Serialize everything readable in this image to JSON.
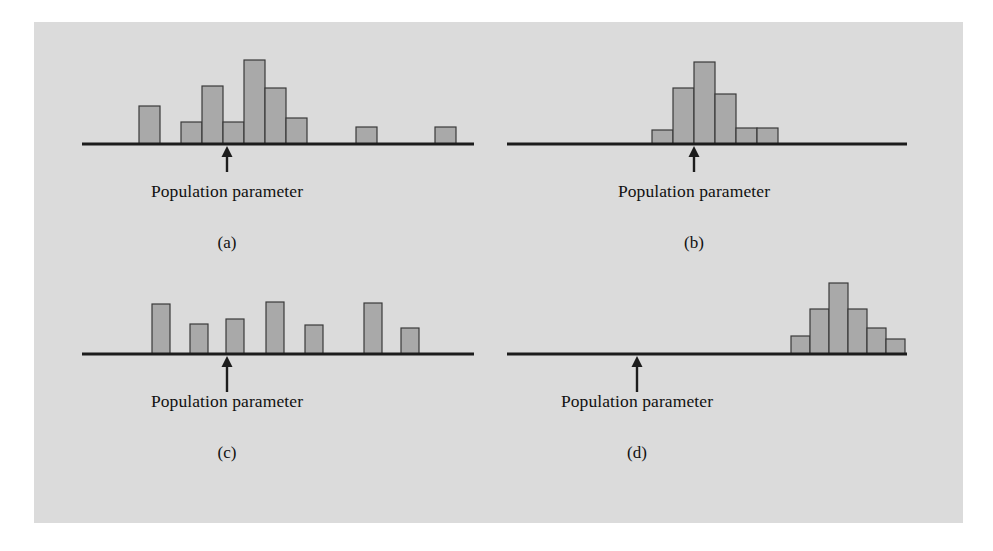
{
  "figure": {
    "background_color": "#dbdbdb",
    "page_color": "#ffffff",
    "bar_fill_color": "#a9a9a9",
    "bar_border_color": "#3a3a3a",
    "axis_color": "#1c1c1c",
    "text_color": "#111111"
  },
  "panels": {
    "a": {
      "caption": "(a)",
      "param_label": "Population parameter",
      "description": "biased, high variability"
    },
    "b": {
      "caption": "(b)",
      "param_label": "Population parameter",
      "description": "unbiased, low variability"
    },
    "c": {
      "caption": "(c)",
      "param_label": "Population parameter",
      "description": "unbiased, high variability"
    },
    "d": {
      "caption": "(d)",
      "param_label": "Population parameter",
      "description": "biased, low variability"
    }
  },
  "chart_data": [
    {
      "type": "bar",
      "panel": "a",
      "title": "(a)",
      "annotation": "Population parameter",
      "parameter_x": 193,
      "axis_start_x": 48,
      "axis_end_x": 440,
      "baseline_y": 122,
      "xlabel": "",
      "ylabel": "",
      "grid": false,
      "bars": [
        {
          "x": 105,
          "width": 21,
          "height": 38
        },
        {
          "x": 147,
          "width": 21,
          "height": 22
        },
        {
          "x": 168,
          "width": 21,
          "height": 58
        },
        {
          "x": 189,
          "width": 21,
          "height": 22
        },
        {
          "x": 210,
          "width": 21,
          "height": 84
        },
        {
          "x": 231,
          "width": 21,
          "height": 56
        },
        {
          "x": 252,
          "width": 21,
          "height": 26
        },
        {
          "x": 322,
          "width": 21,
          "height": 17
        },
        {
          "x": 401,
          "width": 21,
          "height": 17
        }
      ]
    },
    {
      "type": "bar",
      "panel": "b",
      "title": "(b)",
      "annotation": "Population parameter",
      "parameter_x": 195,
      "axis_start_x": 8,
      "axis_end_x": 408,
      "baseline_y": 122,
      "xlabel": "",
      "ylabel": "",
      "grid": false,
      "bars": [
        {
          "x": 153,
          "width": 21,
          "height": 14
        },
        {
          "x": 174,
          "width": 21,
          "height": 56
        },
        {
          "x": 195,
          "width": 21,
          "height": 82
        },
        {
          "x": 216,
          "width": 21,
          "height": 50
        },
        {
          "x": 237,
          "width": 21,
          "height": 16
        },
        {
          "x": 258,
          "width": 21,
          "height": 16
        }
      ]
    },
    {
      "type": "bar",
      "panel": "c",
      "title": "(c)",
      "annotation": "Population parameter",
      "parameter_x": 193,
      "axis_start_x": 48,
      "axis_end_x": 440,
      "baseline_y": 81,
      "xlabel": "",
      "ylabel": "",
      "grid": false,
      "bars": [
        {
          "x": 118,
          "width": 18,
          "height": 50
        },
        {
          "x": 156,
          "width": 18,
          "height": 30
        },
        {
          "x": 192,
          "width": 18,
          "height": 35
        },
        {
          "x": 232,
          "width": 18,
          "height": 52
        },
        {
          "x": 271,
          "width": 18,
          "height": 29
        },
        {
          "x": 330,
          "width": 18,
          "height": 51
        },
        {
          "x": 367,
          "width": 18,
          "height": 26
        }
      ]
    },
    {
      "type": "bar",
      "panel": "d",
      "title": "(d)",
      "annotation": "Population parameter",
      "parameter_x": 138,
      "axis_start_x": 8,
      "axis_end_x": 408,
      "baseline_y": 81,
      "xlabel": "",
      "ylabel": "",
      "grid": false,
      "bars": [
        {
          "x": 292,
          "width": 19,
          "height": 18
        },
        {
          "x": 311,
          "width": 19,
          "height": 45
        },
        {
          "x": 330,
          "width": 19,
          "height": 71
        },
        {
          "x": 349,
          "width": 19,
          "height": 45
        },
        {
          "x": 368,
          "width": 19,
          "height": 26
        },
        {
          "x": 387,
          "width": 19,
          "height": 15
        }
      ]
    }
  ]
}
